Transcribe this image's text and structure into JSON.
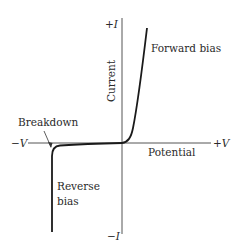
{
  "diagram": {
    "type": "diode I-V characteristic curve",
    "axes": {
      "y_axis_label": "Current",
      "y_positive": "+I",
      "y_negative": "−I",
      "x_axis_label": "Potential",
      "x_positive": "+V",
      "x_negative": "−V"
    },
    "annotations": {
      "forward_bias": "Forward bias",
      "breakdown": "Breakdown",
      "reverse_bias_line1": "Reverse",
      "reverse_bias_line2": "bias"
    },
    "colors": {
      "axis": "#555555",
      "curve": "#1a1a1a",
      "text": "#2a2a2a",
      "background": "#ffffff"
    }
  }
}
